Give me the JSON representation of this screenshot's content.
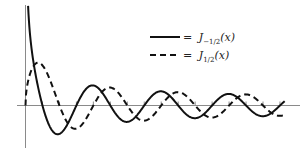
{
  "chart_data": {
    "type": "line",
    "title": "",
    "xlabel": "x",
    "ylabel": "",
    "grid": false,
    "legend_position": "upper right",
    "x_range": [
      0,
      24
    ],
    "y_range": [
      -0.6,
      1.55
    ],
    "x_ticks_spacing": "pi/2",
    "series": [
      {
        "name": "J_{-1/2}(x)",
        "label_main": "J",
        "label_sub": "−1/2",
        "label_arg": "(x)",
        "style": "solid",
        "formula": "sqrt(2/(pi x)) cos x",
        "color": "#111111",
        "sample_points": [
          [
            0.27,
            1.5
          ],
          [
            1.5708,
            0.0
          ],
          [
            3.1416,
            -0.45
          ],
          [
            4.7124,
            0.0
          ],
          [
            6.2832,
            0.32
          ],
          [
            7.854,
            0.0
          ],
          [
            9.4248,
            -0.26
          ],
          [
            12.566,
            0.225
          ],
          [
            15.708,
            -0.2
          ],
          [
            18.85,
            0.18
          ],
          [
            21.99,
            -0.17
          ]
        ]
      },
      {
        "name": "J_{1/2}(x)",
        "label_main": "J",
        "label_sub": "1/2",
        "label_arg": "(x)",
        "style": "dashed",
        "formula": "sqrt(2/(pi x)) sin x",
        "color": "#111111",
        "sample_points": [
          [
            0.0,
            0.0
          ],
          [
            1.17,
            0.67
          ],
          [
            3.1416,
            0.0
          ],
          [
            4.6,
            -0.37
          ],
          [
            6.2832,
            0.0
          ],
          [
            7.8,
            0.28
          ],
          [
            9.4248,
            0.0
          ],
          [
            10.9,
            -0.24
          ],
          [
            14.1,
            0.21
          ],
          [
            17.2,
            -0.19
          ],
          [
            20.4,
            0.18
          ]
        ]
      }
    ],
    "legend": [
      {
        "style": "solid",
        "eq": "=",
        "main": "J",
        "sub": "−1/2",
        "arg": "(x)"
      },
      {
        "style": "dashed",
        "eq": "=",
        "main": "J",
        "sub": "1/2",
        "arg": "(x)"
      }
    ]
  }
}
